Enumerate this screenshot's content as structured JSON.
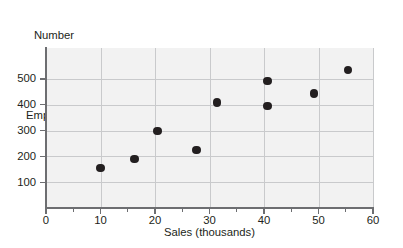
{
  "chart_data": {
    "type": "scatter",
    "title": "",
    "xlabel": "Sales (thousands)",
    "ylabel": "Number of Employees",
    "ylabel_lines": [
      "Number",
      "of",
      "Employees"
    ],
    "xlim": [
      0,
      60
    ],
    "ylim": [
      0,
      620
    ],
    "xticks": [
      0,
      10,
      20,
      30,
      40,
      50,
      60
    ],
    "xtick_labels": [
      "0",
      "10",
      "20",
      "30",
      "40",
      "50",
      "60"
    ],
    "xtick_minor": [
      5,
      15,
      25,
      35,
      45,
      55
    ],
    "yticks": [
      100,
      200,
      300,
      400,
      500
    ],
    "ytick_labels": [
      "100",
      "200",
      "300",
      "400",
      "500"
    ],
    "grid": true,
    "legend": null,
    "points": [
      {
        "x": 10.0,
        "y": 155
      },
      {
        "x": 16.2,
        "y": 190
      },
      {
        "x": 20.5,
        "y": 298
      },
      {
        "x": 27.6,
        "y": 225
      },
      {
        "x": 31.4,
        "y": 408
      },
      {
        "x": 40.6,
        "y": 493
      },
      {
        "x": 40.6,
        "y": 395
      },
      {
        "x": 49.2,
        "y": 443
      },
      {
        "x": 55.4,
        "y": 535
      }
    ],
    "colors": {
      "marker": "#231f20",
      "plot_background": "#f2f2f2",
      "gridline": "#c9cacc",
      "axis": "#6d6e71",
      "text": "#231f20",
      "page_background": "#ffffff"
    }
  }
}
